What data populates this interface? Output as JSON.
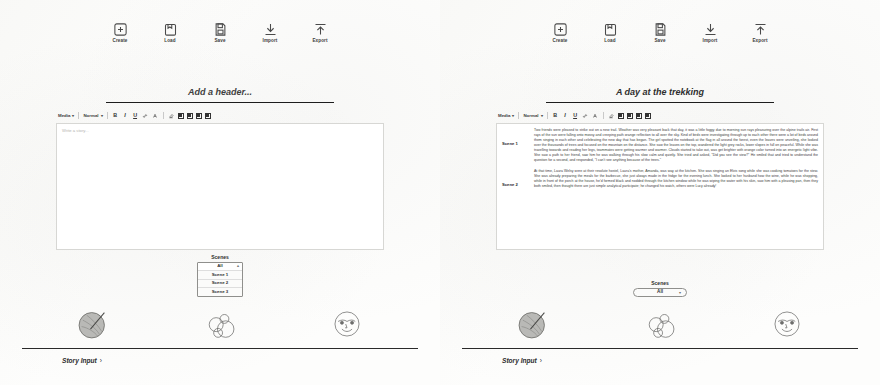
{
  "toolbar": {
    "items": [
      {
        "label": "Create",
        "icon": "plus-square-icon"
      },
      {
        "label": "Load",
        "icon": "folder-open-icon"
      },
      {
        "label": "Save",
        "icon": "floppy-disk-icon"
      },
      {
        "label": "Import",
        "icon": "import-arrow-icon"
      },
      {
        "label": "Export",
        "icon": "export-arrow-icon"
      }
    ]
  },
  "editor_toolbar": {
    "media_label": "Media",
    "style_label": "Normal",
    "bold": "B",
    "italic": "I",
    "underline": "U",
    "link": "link-icon",
    "color": "text-color-icon",
    "highlight": "highlight-icon",
    "align_left": "align-left-icon",
    "align_center": "align-center-icon",
    "align_right": "align-right-icon",
    "list": "list-icon"
  },
  "left": {
    "header_title": "Add a header...",
    "editor_placeholder": "Write a story...",
    "scenes": {
      "label": "Scenes",
      "selected": "All",
      "options": [
        "All",
        "Scene 1",
        "Scene 2",
        "Scene 3"
      ]
    },
    "story_input": {
      "label": "Story Input",
      "chevron": "›"
    },
    "avatars": [
      {
        "name": "avatar-yarn-ball"
      },
      {
        "name": "avatar-bubbles"
      },
      {
        "name": "avatar-face"
      }
    ]
  },
  "right": {
    "header_title": "A day at the trekking",
    "scenes": {
      "label": "Scenes",
      "selected": "All",
      "options": [
        "All",
        "Scene 1",
        "Scene 2",
        "Scene 3"
      ]
    },
    "scene_blocks": [
      {
        "tag": "Scene 1",
        "text": "Two friends were pleased to strike out on a new trail. Weather was very pleasant back that day, it was a little foggy due to morning sun rays pleasuring over the alpine trails air. First rays of the sun were falling onto mossy and creeping path orange reflection to all over the sky. Kind of birds were investigating through up to each other there were a lot of birds around them singing in each other and celebrating the new day that has began. The girl spotted the notebook at the flag in all around the forest, even the leaves were unveiling, she looked over the thousands of trees and focused on the mountain on the distance. She saw the leaves on the top, wandered the light grey rocks, lower slopes in full on peaceful. While she was travelling towards and reading her legs, teammates were getting warmer and warmer. Clouds started to take out, was get brighter with orange color turned into an energetic light vibe. She saw a path to her friend, saw him he was walking through his slow calm and quietly. She tried and asked, \"Did you see the view?\" He smiled that and tried to understand the question for a second, and responded, \"I can't see anything because of the trees.\""
      },
      {
        "tag": "Scene 2",
        "text": "At that time, Laura Welsy were at their resolute hostel, Laura's mother, Amanda, was way at the kitchen. She was singing an Elvis song while she was cooking tomatoes for the stew. She was already preparing the meals for the barbecue, she just always made in the fridge for the evening lunch. She looked to her husband how the wine, while he was shopping, while in front of the porch at the house, he'd formed black and nodded through the kitchen window while he was wiping the water with his skin, saw him with a pleasing pan, then they both smiled, then thought there are just simple analytical participate; he changed his watch, others were Lucy already!"
      }
    ],
    "story_input": {
      "label": "Story Input",
      "chevron": "›"
    },
    "avatars": [
      {
        "name": "avatar-yarn-ball"
      },
      {
        "name": "avatar-bubbles"
      },
      {
        "name": "avatar-face"
      }
    ]
  }
}
